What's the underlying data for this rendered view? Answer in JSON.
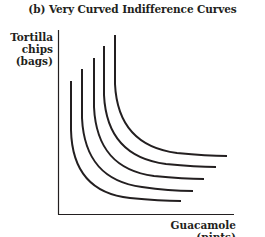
{
  "figure": {
    "title": "(b) Very Curved Indifference Curves",
    "y_axis_label_lines": [
      "Tortilla",
      "chips",
      "(bags)"
    ],
    "x_axis_label": "Guacamole (pints)"
  },
  "diagram": {
    "type": "indifference-curves",
    "curve_count": 5,
    "curve_color": "#231f20",
    "axis_color": "#231f20",
    "curves": [
      {
        "id": 1,
        "top": [
          71,
          81
        ],
        "end": [
          181,
          201
        ]
      },
      {
        "id": 2,
        "top": [
          82,
          69
        ],
        "end": [
          193,
          191
        ]
      },
      {
        "id": 3,
        "top": [
          94,
          58
        ],
        "end": [
          204,
          179
        ]
      },
      {
        "id": 4,
        "top": [
          104,
          46
        ],
        "end": [
          216,
          167
        ]
      },
      {
        "id": 5,
        "top": [
          115,
          35
        ],
        "end": [
          227,
          156
        ]
      }
    ]
  }
}
